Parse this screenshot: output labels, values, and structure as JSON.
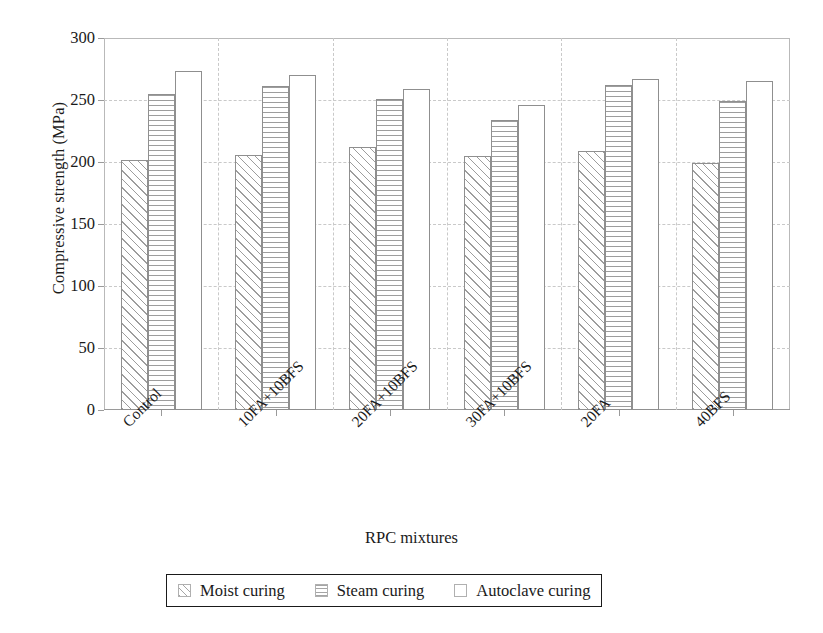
{
  "chart_data": {
    "type": "bar",
    "title": "",
    "xlabel": "RPC mixtures",
    "ylabel": "Compressive strength (MPa)",
    "categories": [
      "Control",
      "10FA+10BFS",
      "20FA+10BFS",
      "30FA+10BFS",
      "20FA",
      "40BFS"
    ],
    "series": [
      {
        "name": "Moist curing",
        "values": [
          202,
          206,
          212,
          205,
          209,
          199
        ]
      },
      {
        "name": "Steam curing",
        "values": [
          255,
          261,
          251,
          234,
          262,
          249
        ]
      },
      {
        "name": "Autoclave curing",
        "values": [
          273,
          270,
          259,
          246,
          267,
          265
        ]
      }
    ],
    "ylim": [
      0,
      300
    ],
    "yticks": [
      0,
      50,
      100,
      150,
      200,
      250,
      300
    ],
    "ytick_labels": [
      "0",
      "50",
      "100",
      "150",
      "200",
      "250",
      "300"
    ],
    "grid": true,
    "grid_style": "dashed",
    "legend_position": "below-axes",
    "legend": [
      "Moist curing",
      "Steam curing",
      "Autoclave curing"
    ],
    "bar_patterns": [
      "diagonal-hatch",
      "horizontal-lines",
      "solid-white"
    ],
    "colors": {
      "bar_face": "#ffffff",
      "bar_edge": "#8f8f8f",
      "grid": "#c9c9c9",
      "axis": "#9a9a9a",
      "text": "#1a1a1a",
      "legend_border": "#1a1a1a"
    }
  }
}
